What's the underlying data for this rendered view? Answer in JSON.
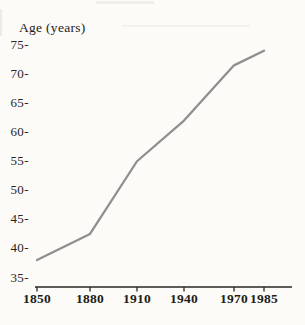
{
  "page": {
    "background_color": "#fcfbf8",
    "text_color": "#2a241d"
  },
  "chart_data": {
    "type": "line",
    "title": "",
    "ylabel": "Age (years)",
    "xlabel": "",
    "x": [
      1850,
      1880,
      1910,
      1940,
      1970,
      1985
    ],
    "x_tick_labels": [
      "1850",
      "1880",
      "1910",
      "1940",
      "1970",
      "1985"
    ],
    "values": [
      38,
      42.5,
      55,
      62,
      71.5,
      74
    ],
    "y_ticks": [
      75,
      70,
      65,
      60,
      55,
      50,
      45,
      40,
      35
    ],
    "y_tick_suffix": "-",
    "ylim": [
      35,
      75
    ],
    "xlim": [
      1850,
      1985
    ],
    "grid": false,
    "legend": "none",
    "line_color": "#8f8f8f",
    "axis_color": "#2b2620"
  }
}
